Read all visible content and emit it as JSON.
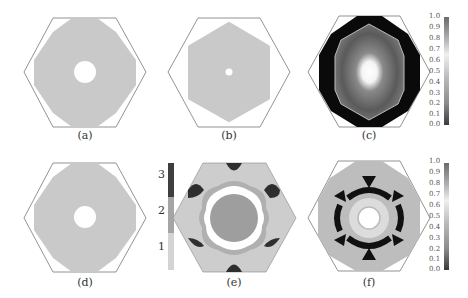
{
  "figure": {
    "panels": [
      {
        "id": "a",
        "label": "(a)",
        "type": "binary-map",
        "fill_color": "#c8c8c8",
        "hole": "large"
      },
      {
        "id": "b",
        "label": "(b)",
        "type": "binary-map",
        "fill_color": "#c8c8c8",
        "hole": "small"
      },
      {
        "id": "c",
        "label": "(c)",
        "type": "continuous-map",
        "colorbar": [
          "1.0",
          "0.9",
          "0.8",
          "0.7",
          "0.6",
          "0.5",
          "0.4",
          "0.3",
          "0.2",
          "0.1",
          "0.0"
        ]
      },
      {
        "id": "d",
        "label": "(d)",
        "type": "binary-map",
        "fill_color": "#c8c8c8",
        "hole": "large"
      },
      {
        "id": "e",
        "label": "(e)",
        "type": "categorical-map",
        "colorbar": [
          "3",
          "2",
          "1"
        ]
      },
      {
        "id": "f",
        "label": "(f)",
        "type": "continuous-map",
        "colorbar": [
          "1.0",
          "0.9",
          "0.8",
          "0.7",
          "0.6",
          "0.5",
          "0.4",
          "0.3",
          "0.2",
          "0.1",
          "0.0"
        ]
      }
    ]
  }
}
